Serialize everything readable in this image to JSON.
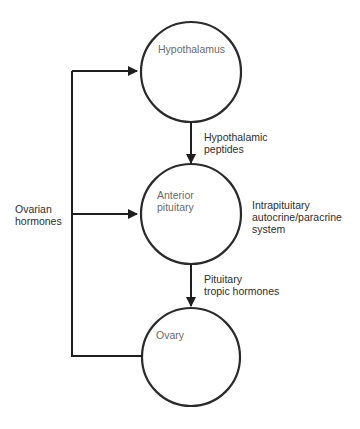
{
  "diagram": {
    "type": "flow-diagram",
    "stroke_color": "#2a2a2a",
    "text_color": "#2e2e2e",
    "node_label_color": "#6a6a6a",
    "background": "#ffffff",
    "nodes": [
      {
        "id": "hypothalamus",
        "label": "Hypothalamus",
        "shape": "circle"
      },
      {
        "id": "anterior-pituitary",
        "label_lines": [
          "Anterior",
          "pituitary"
        ],
        "shape": "circle"
      },
      {
        "id": "ovary",
        "label": "Ovary",
        "shape": "circle"
      }
    ],
    "edges": [
      {
        "from": "hypothalamus",
        "to": "anterior-pituitary",
        "label_lines": [
          "Hypothalamic",
          "peptides"
        ]
      },
      {
        "from": "anterior-pituitary",
        "to": "ovary",
        "label_lines": [
          "Pituitary",
          "tropic hormones"
        ]
      },
      {
        "from": "ovary",
        "to": "hypothalamus",
        "label_lines": [
          "Ovarian",
          "hormones"
        ],
        "kind": "feedback"
      },
      {
        "from": "ovary",
        "to": "anterior-pituitary",
        "label_lines": [
          "Ovarian",
          "hormones"
        ],
        "kind": "feedback"
      }
    ],
    "annotations": [
      {
        "node": "anterior-pituitary",
        "label_lines": [
          "Intrapituitary",
          "autocrine/paracrine",
          "system"
        ]
      }
    ]
  },
  "labels": {
    "hypothalamus": "Hypothalamus",
    "anterior_pituitary_1": "Anterior",
    "anterior_pituitary_2": "pituitary",
    "ovary": "Ovary",
    "hypothalamic_peptides_1": "Hypothalamic",
    "hypothalamic_peptides_2": "peptides",
    "pituitary_tropic_1": "Pituitary",
    "pituitary_tropic_2": "tropic hormones",
    "intrapituitary_1": "Intrapituitary",
    "intrapituitary_2": "autocrine/paracrine",
    "intrapituitary_3": "system",
    "ovarian_hormones_1": "Ovarian",
    "ovarian_hormones_2": "hormones"
  }
}
